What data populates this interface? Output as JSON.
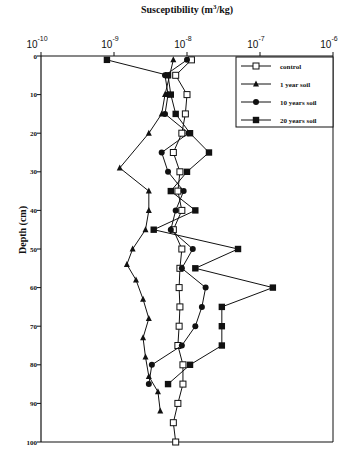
{
  "chart_data": {
    "type": "line",
    "title": "",
    "xlabel": "Susceptibility (m3/kg)",
    "ylabel": "Depth (cm)",
    "x_scale": "log",
    "xlim": [
      1e-10,
      1e-06
    ],
    "ylim": [
      0,
      100
    ],
    "y_inverted": true,
    "x_ticks": [
      {
        "base": "10",
        "exp": "-10"
      },
      {
        "base": "10",
        "exp": "-9"
      },
      {
        "base": "10",
        "exp": "-8"
      },
      {
        "base": "10",
        "exp": "-7"
      },
      {
        "base": "10",
        "exp": "-6"
      }
    ],
    "y_ticks": [
      "0",
      "10",
      "20",
      "30",
      "40",
      "50",
      "60",
      "70",
      "80",
      "90",
      "100"
    ],
    "legend_position": "upper right",
    "grid": false,
    "series": [
      {
        "name": "control",
        "marker": "open-square",
        "points": [
          {
            "depth": 1,
            "value": 1.15e-08
          },
          {
            "depth": 5,
            "value": 7e-09
          },
          {
            "depth": 10,
            "value": 1e-08
          },
          {
            "depth": 15,
            "value": 9.5e-09
          },
          {
            "depth": 20,
            "value": 8.5e-09
          },
          {
            "depth": 25,
            "value": 6.5e-09
          },
          {
            "depth": 30,
            "value": 8e-09
          },
          {
            "depth": 35,
            "value": 7.5e-09
          },
          {
            "depth": 40,
            "value": 8.5e-09
          },
          {
            "depth": 45,
            "value": 6.5e-09
          },
          {
            "depth": 50,
            "value": 8.5e-09
          },
          {
            "depth": 55,
            "value": 8e-09
          },
          {
            "depth": 60,
            "value": 7.8e-09
          },
          {
            "depth": 65,
            "value": 8e-09
          },
          {
            "depth": 70,
            "value": 7.8e-09
          },
          {
            "depth": 75,
            "value": 7.5e-09
          },
          {
            "depth": 80,
            "value": 8.8e-09
          },
          {
            "depth": 85,
            "value": 8.8e-09
          },
          {
            "depth": 90,
            "value": 7.5e-09
          },
          {
            "depth": 95,
            "value": 6.5e-09
          },
          {
            "depth": 100,
            "value": 7e-09
          }
        ]
      },
      {
        "name": "1 year soil",
        "marker": "filled-triangle",
        "points": [
          {
            "depth": 1,
            "value": 6.5e-09
          },
          {
            "depth": 10,
            "value": 5e-09
          },
          {
            "depth": 15,
            "value": 4.5e-09
          },
          {
            "depth": 20,
            "value": 3e-09
          },
          {
            "depth": 29,
            "value": 1.2e-09
          },
          {
            "depth": 35,
            "value": 3e-09
          },
          {
            "depth": 40,
            "value": 3e-09
          },
          {
            "depth": 45,
            "value": 2.7e-09
          },
          {
            "depth": 50,
            "value": 1.8e-09
          },
          {
            "depth": 54,
            "value": 1.5e-09
          },
          {
            "depth": 58,
            "value": 2e-09
          },
          {
            "depth": 63,
            "value": 2.5e-09
          },
          {
            "depth": 68,
            "value": 3e-09
          },
          {
            "depth": 73,
            "value": 2.5e-09
          },
          {
            "depth": 78,
            "value": 2.7e-09
          },
          {
            "depth": 83,
            "value": 3e-09
          },
          {
            "depth": 87,
            "value": 4e-09
          },
          {
            "depth": 92,
            "value": 4.3e-09
          }
        ]
      },
      {
        "name": "10 years soil",
        "marker": "filled-circle",
        "points": [
          {
            "depth": 1,
            "value": 1e-08
          },
          {
            "depth": 5,
            "value": 5e-09
          },
          {
            "depth": 10,
            "value": 5.5e-09
          },
          {
            "depth": 15,
            "value": 5e-09
          },
          {
            "depth": 20,
            "value": 1.05e-08
          },
          {
            "depth": 25,
            "value": 4.5e-09
          },
          {
            "depth": 30,
            "value": 5.5e-09
          },
          {
            "depth": 35,
            "value": 9e-09
          },
          {
            "depth": 40,
            "value": 7e-09
          },
          {
            "depth": 45,
            "value": 6e-09
          },
          {
            "depth": 50,
            "value": 1.2e-08
          },
          {
            "depth": 55,
            "value": 8.5e-09
          },
          {
            "depth": 60,
            "value": 1.8e-08
          },
          {
            "depth": 65,
            "value": 1.6e-08
          },
          {
            "depth": 70,
            "value": 1.3e-08
          },
          {
            "depth": 75,
            "value": 8.5e-09
          },
          {
            "depth": 80,
            "value": 3.3e-09
          },
          {
            "depth": 85,
            "value": 3e-09
          }
        ]
      },
      {
        "name": "20 years soil",
        "marker": "filled-square",
        "points": [
          {
            "depth": 1,
            "value": 8e-10
          },
          {
            "depth": 5,
            "value": 5.5e-09
          },
          {
            "depth": 10,
            "value": 6e-09
          },
          {
            "depth": 15,
            "value": 7e-09
          },
          {
            "depth": 20,
            "value": 1.1e-08
          },
          {
            "depth": 25,
            "value": 2e-08
          },
          {
            "depth": 30,
            "value": 1e-08
          },
          {
            "depth": 35,
            "value": 6e-09
          },
          {
            "depth": 40,
            "value": 1.3e-08
          },
          {
            "depth": 45,
            "value": 3.5e-09
          },
          {
            "depth": 50,
            "value": 5e-08
          },
          {
            "depth": 55,
            "value": 1.3e-08
          },
          {
            "depth": 60,
            "value": 1.5e-07
          },
          {
            "depth": 65,
            "value": 3e-08
          },
          {
            "depth": 70,
            "value": 3e-08
          },
          {
            "depth": 75,
            "value": 3e-08
          },
          {
            "depth": 80,
            "value": 1.1e-08
          },
          {
            "depth": 85,
            "value": 5.5e-09
          }
        ]
      }
    ]
  }
}
